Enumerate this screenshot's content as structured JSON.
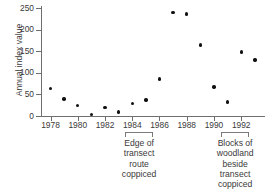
{
  "chart_data": {
    "type": "scatter",
    "title": "",
    "xlabel": "",
    "ylabel": "Annual index value",
    "xlim": [
      1977.3,
      1993.6
    ],
    "ylim": [
      0,
      250
    ],
    "grid": false,
    "legend": "none",
    "x": [
      1978,
      1979,
      1980,
      1981,
      1982,
      1983,
      1984,
      1985,
      1986,
      1987,
      1988,
      1989,
      1990,
      1991,
      1992,
      1993
    ],
    "values": [
      64,
      39,
      24,
      4,
      19,
      9,
      29,
      37,
      86,
      240,
      236,
      164,
      67,
      32,
      148,
      130
    ],
    "points": [
      {
        "x": 1978,
        "y": 64
      },
      {
        "x": 1979,
        "y": 39
      },
      {
        "x": 1980,
        "y": 24
      },
      {
        "x": 1981,
        "y": 4
      },
      {
        "x": 1982,
        "y": 19
      },
      {
        "x": 1983,
        "y": 9
      },
      {
        "x": 1984,
        "y": 29
      },
      {
        "x": 1985,
        "y": 37
      },
      {
        "x": 1986,
        "y": 86
      },
      {
        "x": 1987,
        "y": 240
      },
      {
        "x": 1988,
        "y": 236
      },
      {
        "x": 1989,
        "y": 164
      },
      {
        "x": 1990,
        "y": 67
      },
      {
        "x": 1991,
        "y": 32
      },
      {
        "x": 1992,
        "y": 148
      },
      {
        "x": 1993,
        "y": 130
      }
    ],
    "yticks": [
      0,
      50,
      100,
      150,
      200,
      250
    ],
    "ytick_labels": [
      "0",
      "50",
      "100",
      "150",
      "200",
      "250"
    ],
    "xticks": [
      1978,
      1980,
      1982,
      1984,
      1986,
      1988,
      1990,
      1992
    ],
    "xtick_labels": [
      "1978",
      "1980",
      "1982",
      "1984",
      "1986",
      "1988",
      "1990",
      "1992"
    ],
    "annotations": [
      {
        "name": "edge-of-transect",
        "span": [
          1983.5,
          1985.5
        ],
        "lines": [
          "Edge of",
          "transect",
          "route",
          "coppiced"
        ]
      },
      {
        "name": "blocks-of-woodland",
        "span": [
          1990.5,
          1992.6
        ],
        "lines": [
          "Blocks of",
          "woodland",
          "beside",
          "transect",
          "coppiced"
        ]
      }
    ],
    "colors": {
      "marker": "#111111",
      "axis": "#6e6e6e",
      "text": "#3a3a3a",
      "background": "#ffffff"
    }
  }
}
